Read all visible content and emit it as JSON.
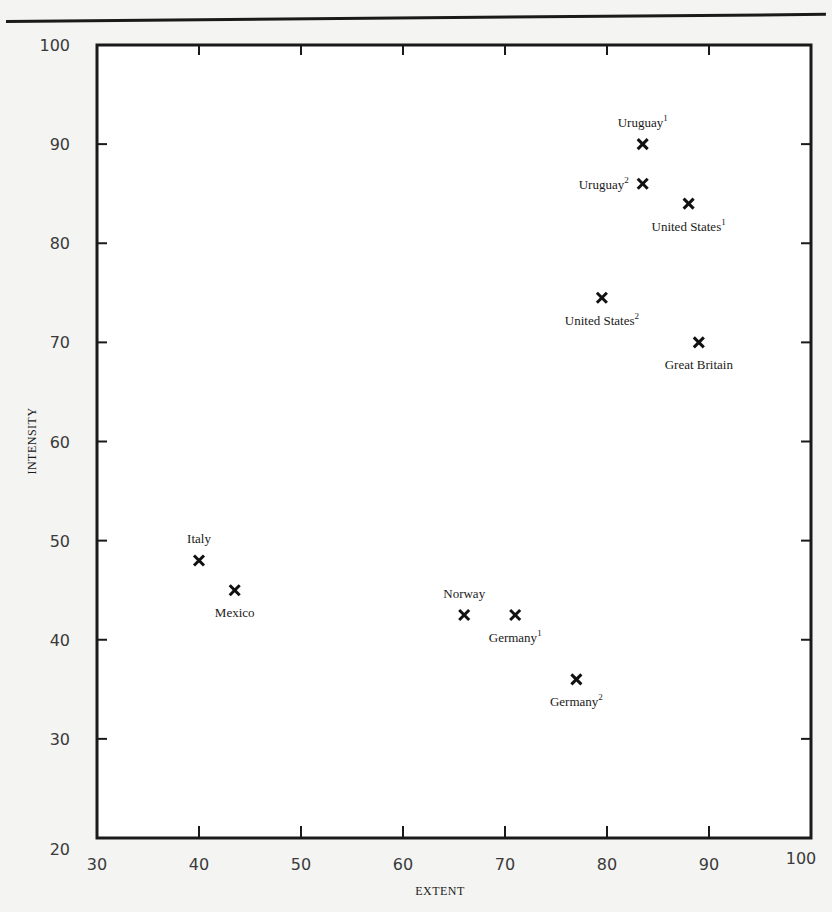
{
  "chart_data": {
    "type": "scatter",
    "title": "",
    "xlabel": "EXTENT",
    "ylabel": "INTENSITY",
    "xlim": [
      30,
      100
    ],
    "ylim": [
      20,
      100
    ],
    "xticks": [
      30,
      40,
      50,
      60,
      70,
      80,
      90,
      100
    ],
    "yticks": [
      20,
      30,
      40,
      50,
      60,
      70,
      80,
      90,
      100
    ],
    "grid": false,
    "legend": null,
    "marker": "x",
    "points": [
      {
        "label": "Uruguay",
        "sup": "1",
        "x": 83.5,
        "y": 90,
        "label_pos": "above"
      },
      {
        "label": "Uruguay",
        "sup": "2",
        "x": 83.5,
        "y": 86,
        "label_pos": "left"
      },
      {
        "label": "United States",
        "sup": "1",
        "x": 88,
        "y": 84,
        "label_pos": "below"
      },
      {
        "label": "United States",
        "sup": "2",
        "x": 79.5,
        "y": 74.5,
        "label_pos": "below"
      },
      {
        "label": "Great Britain",
        "sup": "",
        "x": 89,
        "y": 70,
        "label_pos": "below"
      },
      {
        "label": "Italy",
        "sup": "",
        "x": 40,
        "y": 48,
        "label_pos": "above"
      },
      {
        "label": "Mexico",
        "sup": "",
        "x": 43.5,
        "y": 45,
        "label_pos": "below"
      },
      {
        "label": "Norway",
        "sup": "",
        "x": 66,
        "y": 42.5,
        "label_pos": "above"
      },
      {
        "label": "Germany",
        "sup": "1",
        "x": 71,
        "y": 42.5,
        "label_pos": "below"
      },
      {
        "label": "Germany",
        "sup": "2",
        "x": 77,
        "y": 36,
        "label_pos": "below"
      }
    ]
  },
  "colors": {
    "ink": "#1a1a1a",
    "paper": "#f4f4f2",
    "tick_text": "#3a3a3a"
  }
}
